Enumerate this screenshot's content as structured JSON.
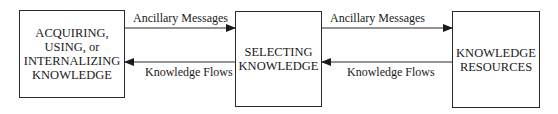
{
  "nodes": [
    {
      "id": "acquiring",
      "label": "ACQUIRING,\nUSING, or\nINTERNALIZING\nKNOWLEDGE"
    },
    {
      "id": "selecting",
      "label": "SELECTING\nKNOWLEDGE"
    },
    {
      "id": "resources",
      "label": "KNOWLEDGE\nRESOURCES"
    }
  ],
  "edges": [
    {
      "from": "acquiring",
      "to": "selecting",
      "label": "Ancillary Messages"
    },
    {
      "from": "selecting",
      "to": "acquiring",
      "label": "Knowledge Flows"
    },
    {
      "from": "selecting",
      "to": "resources",
      "label": "Ancillary Messages"
    },
    {
      "from": "resources",
      "to": "selecting",
      "label": "Knowledge Flows"
    }
  ],
  "colors": {
    "stroke": "#2a2a2a",
    "text": "#1a1a1a",
    "background": "#ffffff"
  }
}
